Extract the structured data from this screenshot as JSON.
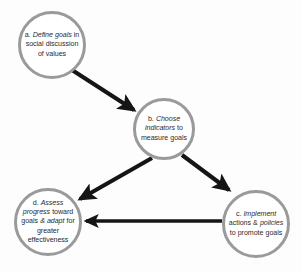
{
  "diagram": {
    "type": "cycle-flow",
    "background_color": "#fdfdfd",
    "circle_border_color": "#9a9a9a",
    "arrow_color": "#151515",
    "text_color": "#2b2b2b",
    "nodes": [
      {
        "id": "a",
        "marker": "a.",
        "emphasis_lead": "Define goals",
        "rest": "in social discussion of values",
        "full_text": "a. Define goals in social discussion of values"
      },
      {
        "id": "b",
        "marker": "b.",
        "emphasis_lead": "Choose indicators",
        "rest": "to measure goals",
        "full_text": "b. Choose indicators to measure goals"
      },
      {
        "id": "c",
        "marker": "c.",
        "emphasis_lead": "Implement",
        "mid": "actions &",
        "emphasis_two": "policies",
        "rest": "to promote goals",
        "full_text": "c. Implement actions & policies to promote goals"
      },
      {
        "id": "d",
        "marker": "d.",
        "emphasis_lead": "Assess progress",
        "mid": "toward goals",
        "emphasis_two": "& adapt",
        "rest": "for greater effectiveness",
        "full_text": "d. Assess progress toward goals & adapt for greater effectiveness"
      }
    ],
    "arrows": [
      {
        "id": "a-to-b",
        "from": "a",
        "to": "b",
        "direction": "down-right"
      },
      {
        "id": "b-to-c",
        "from": "b",
        "to": "c",
        "direction": "down-right"
      },
      {
        "id": "c-to-d",
        "from": "c",
        "to": "d",
        "direction": "left"
      },
      {
        "id": "b-to-d",
        "from": "b",
        "to": "d",
        "direction": "down-left"
      }
    ]
  }
}
